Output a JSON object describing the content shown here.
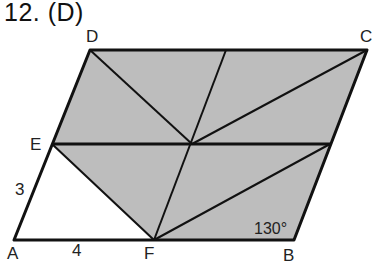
{
  "title": "12. (D)",
  "figure": {
    "type": "parallelogram",
    "fill_color": "#bdbdbd",
    "line_color": "#111111",
    "vertices": {
      "A": {
        "label": "A",
        "x": 14,
        "y": 240
      },
      "B": {
        "label": "B",
        "x": 294,
        "y": 240
      },
      "C": {
        "label": "C",
        "x": 367,
        "y": 50
      },
      "D": {
        "label": "D",
        "x": 90,
        "y": 50
      },
      "E": {
        "label": "E",
        "x": 52,
        "y": 144
      },
      "F": {
        "label": "F",
        "x": 154,
        "y": 240
      }
    },
    "measurements": {
      "AE": "3",
      "AF": "4",
      "angle_B": "130°"
    }
  }
}
